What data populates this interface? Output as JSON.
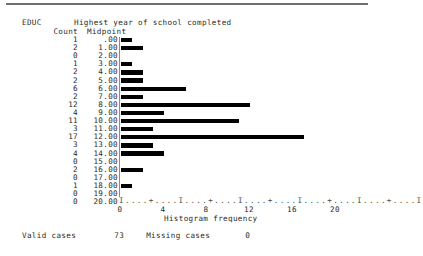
{
  "header": {
    "variable": "EDUC",
    "variable_label": "Highest year of school completed",
    "count_column_header": "Count",
    "midpoint_column_header": "Midpoint"
  },
  "axis": {
    "ruler": "I....+....I....+....I....+....I....+....I....+....I",
    "tick_labels": [
      "0",
      "4",
      "8",
      "12",
      "16",
      "20"
    ],
    "tick_values": [
      0,
      4,
      8,
      12,
      16,
      20
    ],
    "title": "Histogram frequency"
  },
  "footer": {
    "valid_cases_label": "Valid cases",
    "valid_cases_value": "73",
    "missing_cases_label": "Missing cases",
    "missing_cases_value": "0"
  },
  "colors": {
    "bar": "#000000",
    "axis_line": "#8a8a8a",
    "text": "#2b2b2b",
    "top_rule": "#6f6f6f",
    "background": "#ffffff"
  },
  "chart_data": {
    "type": "bar",
    "orientation": "horizontal",
    "title": "Highest year of school completed",
    "xlabel": "Histogram frequency",
    "ylabel": "Midpoint",
    "xlim": [
      0,
      20
    ],
    "grid": false,
    "legend": false,
    "categories": [
      ".00",
      "1.00",
      "2.00",
      "3.00",
      "4.00",
      "5.00",
      "6.00",
      "7.00",
      "8.00",
      "9.00",
      "10.00",
      "11.00",
      "12.00",
      "13.00",
      "14.00",
      "15.00",
      "16.00",
      "17.00",
      "18.00",
      "19.00",
      "20.00"
    ],
    "values": [
      1,
      2,
      0,
      1,
      2,
      2,
      6,
      2,
      12,
      4,
      11,
      3,
      17,
      3,
      4,
      0,
      2,
      0,
      1,
      0,
      0
    ],
    "rows": [
      {
        "count": "1",
        "midpoint": ".00",
        "value": 1
      },
      {
        "count": "2",
        "midpoint": "1.00",
        "value": 2
      },
      {
        "count": "0",
        "midpoint": "2.00",
        "value": 0
      },
      {
        "count": "1",
        "midpoint": "3.00",
        "value": 1
      },
      {
        "count": "2",
        "midpoint": "4.00",
        "value": 2
      },
      {
        "count": "2",
        "midpoint": "5.00",
        "value": 2
      },
      {
        "count": "6",
        "midpoint": "6.00",
        "value": 6
      },
      {
        "count": "2",
        "midpoint": "7.00",
        "value": 2
      },
      {
        "count": "12",
        "midpoint": "8.00",
        "value": 12
      },
      {
        "count": "4",
        "midpoint": "9.00",
        "value": 4
      },
      {
        "count": "11",
        "midpoint": "10.00",
        "value": 11
      },
      {
        "count": "3",
        "midpoint": "11.00",
        "value": 3
      },
      {
        "count": "17",
        "midpoint": "12.00",
        "value": 17
      },
      {
        "count": "3",
        "midpoint": "13.00",
        "value": 3
      },
      {
        "count": "4",
        "midpoint": "14.00",
        "value": 4
      },
      {
        "count": "0",
        "midpoint": "15.00",
        "value": 0
      },
      {
        "count": "2",
        "midpoint": "16.00",
        "value": 2
      },
      {
        "count": "0",
        "midpoint": "17.00",
        "value": 0
      },
      {
        "count": "1",
        "midpoint": "18.00",
        "value": 1
      },
      {
        "count": "0",
        "midpoint": "19.00",
        "value": 0
      },
      {
        "count": "0",
        "midpoint": "20.00",
        "value": 0
      }
    ]
  }
}
